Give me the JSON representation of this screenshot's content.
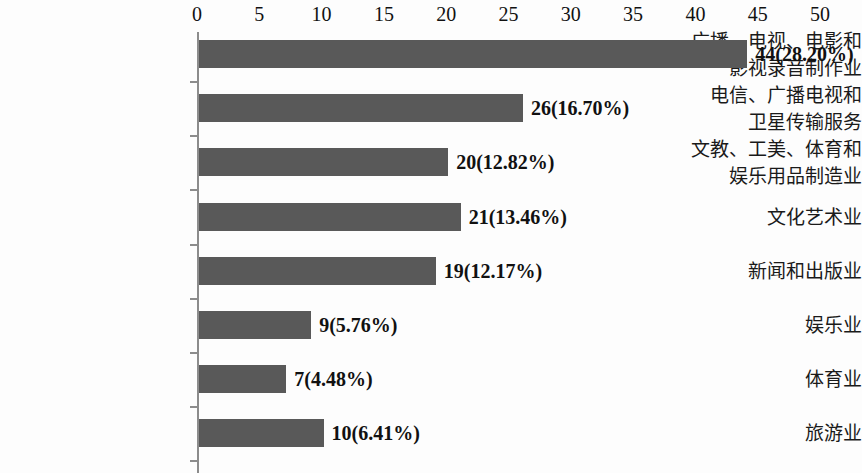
{
  "chart_data": {
    "type": "bar",
    "orientation": "horizontal",
    "title": "",
    "subtitle": "",
    "xlabel": "",
    "ylabel": "",
    "xlim": [
      0,
      50
    ],
    "grid": false,
    "legend": null,
    "axis_position": "top",
    "tick_labels": [
      "0",
      "5",
      "10",
      "15",
      "20",
      "25",
      "30",
      "35",
      "40",
      "45",
      "50"
    ],
    "tick_values": [
      0,
      5,
      10,
      15,
      20,
      25,
      30,
      35,
      40,
      45,
      50
    ],
    "categories": [
      "广播、电视、电影和\n影视录音制作业",
      "电信、广播电视和\n卫星传输服务",
      "文教、工美、体育和\n娱乐用品制造业",
      "文化艺术业",
      "新闻和出版业",
      "娱乐业",
      "体育业",
      "旅游业"
    ],
    "values": [
      44,
      26,
      20,
      21,
      19,
      9,
      7,
      10
    ],
    "percents": [
      28.2,
      16.7,
      12.82,
      13.46,
      12.17,
      5.76,
      4.48,
      6.41
    ],
    "data_labels": [
      "44(28.20%)",
      "26(16.70%)",
      "20(12.82%)",
      "21(13.46%)",
      "19(12.17%)",
      "9(5.76%)",
      "7(4.48%)",
      "10(6.41%)"
    ],
    "colors": {
      "bar": "#595959",
      "axis": "#8c8c8c",
      "text": "#111111",
      "background": "#fdfdfd"
    }
  }
}
